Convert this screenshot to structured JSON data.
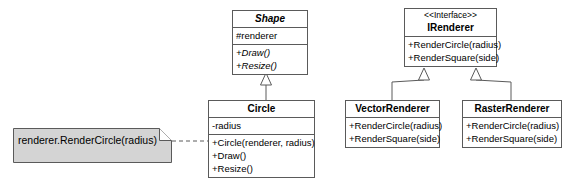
{
  "diagram": {
    "type": "uml-class-diagram",
    "background_color": "#ffffff",
    "line_color": "#5a5a5a",
    "note_fill_color": "#d4d4d4",
    "box_fill_color": "#ffffff"
  },
  "classes": {
    "shape": {
      "name": "Shape",
      "is_abstract": true,
      "attributes": [
        "#renderer"
      ],
      "operations": [
        "+Draw()",
        "+Resize()"
      ]
    },
    "circle": {
      "name": "Circle",
      "is_abstract": false,
      "attributes": [
        "-radius"
      ],
      "operations": [
        "+Circle(renderer, radius)",
        "+Draw()",
        "+Resize()"
      ]
    },
    "irenderer": {
      "stereotype": "<<Interface>>",
      "name": "IRenderer",
      "is_abstract": false,
      "operations": [
        "+RenderCircle(radius)",
        "+RenderSquare(side)"
      ]
    },
    "vector_renderer": {
      "name": "VectorRenderer",
      "is_abstract": false,
      "operations": [
        "+RenderCircle(radius)",
        "+RenderSquare(side)"
      ]
    },
    "raster_renderer": {
      "name": "RasterRenderer",
      "is_abstract": false,
      "operations": [
        "+RenderCircle(radius)",
        "+RenderSquare(side)"
      ]
    }
  },
  "note": {
    "text": "renderer.RenderCircle(radius)"
  },
  "relationships": [
    {
      "type": "generalization",
      "from": "Circle",
      "to": "Shape"
    },
    {
      "type": "realization",
      "from": "VectorRenderer",
      "to": "IRenderer"
    },
    {
      "type": "realization",
      "from": "RasterRenderer",
      "to": "IRenderer"
    },
    {
      "type": "note-anchor",
      "from": "note",
      "to": "Circle"
    }
  ]
}
